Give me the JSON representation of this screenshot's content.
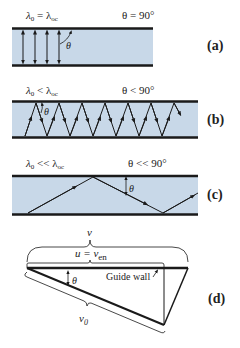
{
  "colors": {
    "guide_fill": "#c8d8e8",
    "wall": "#1a1a1a",
    "ray": "#1a1a1a"
  },
  "panels": [
    {
      "id": "a",
      "label": "(a)",
      "condition_left": "λ",
      "condition_left_sub": "0",
      "condition_op": " = λ",
      "condition_right_sub": "oc",
      "angle_text": "θ = 90°",
      "theta": "θ"
    },
    {
      "id": "b",
      "label": "(b)",
      "condition_left": "λ",
      "condition_left_sub": "0",
      "condition_op": " < λ",
      "condition_right_sub": "oc",
      "angle_text": "θ < 90°",
      "theta": "θ"
    },
    {
      "id": "c",
      "label": "(c)",
      "condition_left": "λ",
      "condition_left_sub": "0",
      "condition_op": " << λ",
      "condition_right_sub": "oc",
      "angle_text": "θ << 90°",
      "theta": "θ"
    },
    {
      "id": "d",
      "label": "(d)",
      "v_label": "v",
      "u_label": "u = v",
      "u_sub": "en",
      "v0_label": "v",
      "v0_sub": "0",
      "theta": "θ",
      "guide_wall": "Guide wall"
    }
  ]
}
